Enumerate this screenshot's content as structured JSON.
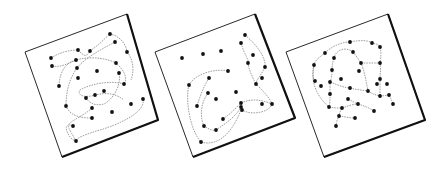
{
  "figure": {
    "width": 448,
    "height": 171,
    "background": "#ffffff",
    "stroke_color": "#111111",
    "dot_color": "#111111",
    "curve_color": "#777777",
    "panels": [
      {
        "id": "panel-1",
        "corners": [
          [
            25,
            52
          ],
          [
            127,
            14
          ],
          [
            158,
            120
          ],
          [
            62,
            157
          ]
        ],
        "shadow": [
          [
            127,
            14
          ],
          [
            158,
            120
          ],
          [
            62,
            157
          ]
        ],
        "dots": [
          [
            51,
            58
          ],
          [
            78,
            50
          ],
          [
            90,
            51
          ],
          [
            110,
            34
          ],
          [
            115,
            42
          ],
          [
            127,
            52
          ],
          [
            52,
            66
          ],
          [
            76,
            60
          ],
          [
            116,
            63
          ],
          [
            77,
            68
          ],
          [
            97,
            71
          ],
          [
            119,
            73
          ],
          [
            59,
            86
          ],
          [
            78,
            78
          ],
          [
            124,
            84
          ],
          [
            104,
            91
          ],
          [
            95,
            95
          ],
          [
            86,
            98
          ],
          [
            66,
            106
          ],
          [
            92,
            108
          ],
          [
            143,
            99
          ],
          [
            131,
            104
          ],
          [
            112,
            112
          ],
          [
            92,
            118
          ],
          [
            73,
            126
          ],
          [
            76,
            141
          ]
        ],
        "curves": [
          "M51,58 C60,52 70,50 78,50 C84,56 86,58 90,51 C100,44 105,38 110,34 C120,36 126,44 127,52",
          "M52,66 C62,68 70,62 76,60 C90,56 106,58 116,63 C124,70 128,78 124,84",
          "M115,42 C100,50 85,58 77,68 C70,78 66,90 66,106 C70,116 80,118 92,118",
          "M124,84 C110,80 90,84 80,90 C76,96 86,98 95,95 C108,92 116,94 124,100",
          "M59,86 C60,70 66,62 78,60",
          "M143,99 C146,112 120,124 100,130 C86,134 76,138 76,141 C70,130 64,122 73,126",
          "M92,108 C84,116 70,120 66,128 C68,136 72,140 76,141",
          "M86,98 C90,104 96,106 104,104 C112,100 122,86 119,73",
          "M127,52 C134,60 134,72 131,80"
        ]
      },
      {
        "id": "panel-2",
        "corners": [
          [
            155,
            52
          ],
          [
            255,
            14
          ],
          [
            295,
            118
          ],
          [
            193,
            157
          ]
        ],
        "shadow": [
          [
            255,
            14
          ],
          [
            295,
            118
          ],
          [
            193,
            157
          ]
        ],
        "dots": [
          [
            245,
            35
          ],
          [
            241,
            43
          ],
          [
            221,
            51
          ],
          [
            182,
            58
          ],
          [
            203,
            54
          ],
          [
            253,
            55
          ],
          [
            248,
            63
          ],
          [
            265,
            67
          ],
          [
            228,
            71
          ],
          [
            209,
            78
          ],
          [
            262,
            78
          ],
          [
            189,
            85
          ],
          [
            256,
            84
          ],
          [
            208,
            93
          ],
          [
            236,
            92
          ],
          [
            216,
            99
          ],
          [
            197,
            106
          ],
          [
            241,
            103
          ],
          [
            241,
            107
          ],
          [
            242,
            110
          ],
          [
            262,
            104
          ],
          [
            272,
            104
          ],
          [
            223,
            119
          ],
          [
            204,
            126
          ],
          [
            216,
            130
          ],
          [
            201,
            142
          ]
        ],
        "curves": [
          "M189,85 C195,74 215,68 228,71",
          "M189,85 C185,100 190,130 201,142 C215,146 230,138 241,110",
          "M208,93 C200,104 200,118 204,126 C210,130 214,131 216,130 C228,122 236,116 241,107",
          "M241,103 C252,98 262,100 272,104 C270,112 252,116 242,110",
          "M245,35 C258,46 266,58 265,67 C262,74 256,80 256,84 C262,90 270,98 272,104",
          "M241,43 C244,54 250,62 248,63 C250,74 254,80 256,84",
          "M209,78 C204,86 200,96 197,106",
          "M223,119 C230,114 236,108 241,103"
        ]
      },
      {
        "id": "panel-3",
        "corners": [
          [
            286,
            52
          ],
          [
            388,
            14
          ],
          [
            425,
            120
          ],
          [
            324,
            157
          ]
        ],
        "shadow": [
          [
            388,
            14
          ],
          [
            425,
            120
          ],
          [
            324,
            157
          ]
        ],
        "dots": [
          [
            350,
            42
          ],
          [
            372,
            43
          ],
          [
            380,
            47
          ],
          [
            325,
            53
          ],
          [
            353,
            52
          ],
          [
            334,
            58
          ],
          [
            314,
            65
          ],
          [
            361,
            63
          ],
          [
            380,
            63
          ],
          [
            332,
            70
          ],
          [
            359,
            71
          ],
          [
            380,
            79
          ],
          [
            341,
            79
          ],
          [
            315,
            81
          ],
          [
            321,
            86
          ],
          [
            330,
            82
          ],
          [
            350,
            88
          ],
          [
            377,
            84
          ],
          [
            387,
            84
          ],
          [
            368,
            91
          ],
          [
            380,
            96
          ],
          [
            389,
            95
          ],
          [
            330,
            94
          ],
          [
            348,
            99
          ],
          [
            358,
            104
          ],
          [
            393,
            104
          ],
          [
            329,
            107
          ],
          [
            342,
            108
          ],
          [
            374,
            111
          ],
          [
            339,
            116
          ],
          [
            355,
            118
          ],
          [
            336,
            126
          ]
        ],
        "curves": [
          "M325,53 C334,44 345,42 350,42 C360,40 368,40 372,43 C378,44 380,46 380,47",
          "M325,53 C318,58 314,62 314,65 C312,76 314,82 315,81",
          "M314,65 C310,80 316,96 329,107",
          "M353,52 C345,46 336,50 334,58",
          "M380,47 C382,56 380,60 380,63 C381,70 380,76 380,79 C380,86 380,92 380,96",
          "M361,63 C370,63 376,63 380,63",
          "M353,52 C358,58 360,62 361,63 C364,70 366,80 368,91",
          "M330,82 C340,86 346,88 350,88 C358,90 362,90 368,91 C372,94 376,95 380,96 C384,96 388,95 389,95",
          "M334,58 C332,64 332,68 332,70 C332,76 331,80 330,82 C330,86 330,90 330,94 C330,100 330,104 329,107",
          "M329,107 C334,108 338,108 342,108 C348,106 354,104 358,104",
          "M342,108 C340,112 339,114 339,116 C337,120 336,124 336,126",
          "M339,116 C346,117 350,118 355,118",
          "M358,104 C364,106 370,108 374,111",
          "M348,99 C352,101 355,103 358,104",
          "M389,95 C391,99 392,101 393,104"
        ]
      }
    ]
  }
}
